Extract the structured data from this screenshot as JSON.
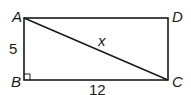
{
  "diagram": {
    "vertices": [
      {
        "id": "A",
        "label": "A"
      },
      {
        "id": "B",
        "label": "B"
      },
      {
        "id": "C",
        "label": "C"
      },
      {
        "id": "D",
        "label": "D"
      }
    ],
    "labels": {
      "side_ab": "5",
      "side_bc": "12",
      "diagonal_ac": "x"
    },
    "right_angle_at": "B",
    "stroke_color": "#1a1a1a"
  }
}
